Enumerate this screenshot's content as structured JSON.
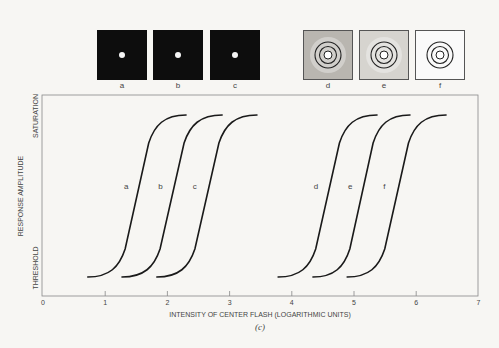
{
  "stimuli": {
    "panels": [
      {
        "id": "a",
        "label": "a",
        "type": "dark-spot"
      },
      {
        "id": "b",
        "label": "b",
        "type": "dark-spot"
      },
      {
        "id": "c",
        "label": "c",
        "type": "dark-spot"
      },
      {
        "id": "d",
        "label": "d",
        "type": "rings-noisy-dark"
      },
      {
        "id": "e",
        "label": "e",
        "type": "rings-noisy-light"
      },
      {
        "id": "f",
        "label": "f",
        "type": "rings-clean"
      }
    ]
  },
  "chart_data": {
    "type": "line",
    "title": "",
    "caption": "(c)",
    "xlabel": "INTENSITY OF CENTER FLASH (LOGARITHMIC UNITS)",
    "ylabel": "RESPONSE AMPLITUDE",
    "y_tick_labels": {
      "bottom": "THRESHOLD",
      "top": "SATURATION"
    },
    "xlim": [
      0,
      7
    ],
    "ylim": [
      0,
      1
    ],
    "x_ticks": [
      0,
      1,
      2,
      3,
      4,
      5,
      6,
      7
    ],
    "grid": false,
    "legend": "inline labels",
    "series": [
      {
        "name": "a",
        "start_x": 0.72,
        "end_x": 2.3,
        "midpoint_x": 1.5
      },
      {
        "name": "b",
        "start_x": 1.27,
        "end_x": 2.88,
        "midpoint_x": 2.05
      },
      {
        "name": "c",
        "start_x": 1.83,
        "end_x": 3.44,
        "midpoint_x": 2.6
      },
      {
        "name": "d",
        "start_x": 3.78,
        "end_x": 5.37,
        "midpoint_x": 4.55
      },
      {
        "name": "e",
        "start_x": 4.34,
        "end_x": 5.9,
        "midpoint_x": 5.1
      },
      {
        "name": "f",
        "start_x": 4.89,
        "end_x": 6.48,
        "midpoint_x": 5.65
      }
    ],
    "annotations": [
      "a",
      "b",
      "c",
      "d",
      "e",
      "f"
    ]
  },
  "colors": {
    "background": "#f7f6f3",
    "curve": "#1a1a1a",
    "axis": "#888888",
    "panel_dark": "#0d0d0d"
  }
}
